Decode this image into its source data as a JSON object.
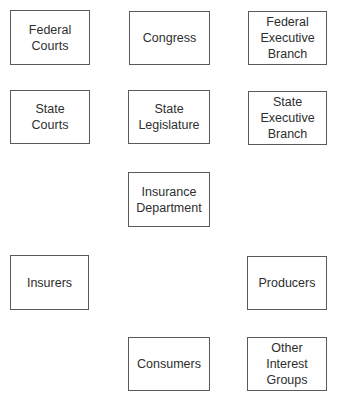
{
  "diagram": {
    "type": "grid-of-boxes",
    "border_color": "#5a5a5a",
    "text_color": "#2e2e2e",
    "background": "#ffffff",
    "nodes": [
      {
        "id": "federal-courts",
        "label": "Federal\nCourts",
        "x": 10,
        "y": 10,
        "w": 80,
        "h": 55
      },
      {
        "id": "congress",
        "label": "Congress",
        "x": 129,
        "y": 11,
        "w": 81,
        "h": 54
      },
      {
        "id": "federal-executive",
        "label": "Federal\nExecutive\nBranch",
        "x": 248,
        "y": 11,
        "w": 79,
        "h": 54
      },
      {
        "id": "state-courts",
        "label": "State\nCourts",
        "x": 10,
        "y": 90,
        "w": 80,
        "h": 54
      },
      {
        "id": "state-legislature",
        "label": "State\nLegislature",
        "x": 128,
        "y": 90,
        "w": 82,
        "h": 54
      },
      {
        "id": "state-executive",
        "label": "State\nExecutive\nBranch",
        "x": 248,
        "y": 91,
        "w": 79,
        "h": 54
      },
      {
        "id": "insurance-department",
        "label": "Insurance\nDepartment",
        "x": 128,
        "y": 172,
        "w": 82,
        "h": 55
      },
      {
        "id": "insurers",
        "label": "Insurers",
        "x": 10,
        "y": 255,
        "w": 79,
        "h": 55
      },
      {
        "id": "producers",
        "label": "Producers",
        "x": 247,
        "y": 256,
        "w": 80,
        "h": 54
      },
      {
        "id": "consumers",
        "label": "Consumers",
        "x": 128,
        "y": 337,
        "w": 82,
        "h": 54
      },
      {
        "id": "other-interest-groups",
        "label": "Other\nInterest\nGroups",
        "x": 247,
        "y": 337,
        "w": 80,
        "h": 54
      }
    ],
    "edges": []
  }
}
